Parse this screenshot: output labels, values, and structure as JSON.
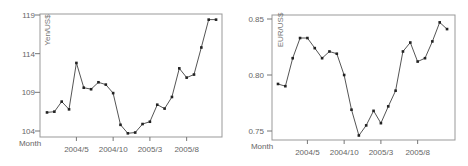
{
  "chart_data": [
    {
      "type": "line",
      "title": "",
      "xlabel": "Month",
      "ylabel": "Yen/US$",
      "x_tick_labels": [
        "2004/5",
        "2004/10",
        "2005/3",
        "2005/8"
      ],
      "y_tick_labels": [
        "104",
        "109",
        "114",
        "119"
      ],
      "ylim": [
        103.5,
        119.2
      ],
      "x": [
        "2004/1",
        "2004/2",
        "2004/3",
        "2004/4",
        "2004/5",
        "2004/6",
        "2004/7",
        "2004/8",
        "2004/9",
        "2004/10",
        "2004/11",
        "2004/12",
        "2005/1",
        "2005/2",
        "2005/3",
        "2005/4",
        "2005/5",
        "2005/6",
        "2005/7",
        "2005/8",
        "2005/9",
        "2005/10",
        "2005/11",
        "2005/12"
      ],
      "values": [
        106.4,
        106.5,
        107.8,
        106.8,
        112.8,
        109.6,
        109.4,
        110.3,
        110.0,
        108.9,
        104.8,
        103.7,
        103.8,
        104.9,
        105.2,
        107.4,
        106.9,
        108.4,
        112.1,
        110.9,
        111.3,
        114.8,
        118.4,
        118.4
      ],
      "line_color": "#555555",
      "marker_color": "#222222",
      "grid": false
    },
    {
      "type": "line",
      "title": "",
      "xlabel": "Month",
      "ylabel": "EUR/US$",
      "x_tick_labels": [
        "2004/5",
        "2004/10",
        "2005/3",
        "2005/8"
      ],
      "y_tick_labels": [
        "0.75",
        "0.80",
        "0.85"
      ],
      "ylim": [
        0.745,
        0.853
      ],
      "x": [
        "2004/1",
        "2004/2",
        "2004/3",
        "2004/4",
        "2004/5",
        "2004/6",
        "2004/7",
        "2004/8",
        "2004/9",
        "2004/10",
        "2004/11",
        "2004/12",
        "2005/1",
        "2005/2",
        "2005/3",
        "2005/4",
        "2005/5",
        "2005/6",
        "2005/7",
        "2005/8",
        "2005/9",
        "2005/10",
        "2005/11",
        "2005/12"
      ],
      "values": [
        0.792,
        0.79,
        0.815,
        0.833,
        0.833,
        0.824,
        0.815,
        0.821,
        0.819,
        0.8,
        0.769,
        0.746,
        0.755,
        0.768,
        0.757,
        0.772,
        0.786,
        0.821,
        0.829,
        0.812,
        0.815,
        0.83,
        0.847,
        0.841
      ],
      "line_color": "#555555",
      "marker_color": "#222222",
      "grid": false
    }
  ]
}
